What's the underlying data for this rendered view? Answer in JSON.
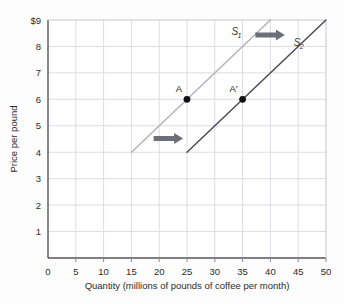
{
  "chart_data": {
    "type": "line",
    "title": "",
    "xlabel": "Quantity (millions of pounds of coffee per month)",
    "ylabel": "Price per pound",
    "xlim": [
      0,
      50
    ],
    "ylim": [
      0,
      9
    ],
    "xticks": [
      "0",
      "5",
      "10",
      "15",
      "20",
      "25",
      "30",
      "35",
      "40",
      "45",
      "50"
    ],
    "yticks": [
      "1",
      "2",
      "3",
      "4",
      "5",
      "6",
      "7",
      "8",
      "$9"
    ],
    "grid": true,
    "legend_position": "inline-curve-labels",
    "series": [
      {
        "name": "S1",
        "label": "S",
        "subscript": "1",
        "color": "#b3b3bb",
        "points": [
          [
            15,
            4
          ],
          [
            40,
            9
          ]
        ],
        "label_x": 33,
        "label_y": 8.45
      },
      {
        "name": "S2",
        "label": "S",
        "subscript": "2",
        "color": "#4c4c57",
        "points": [
          [
            25,
            4
          ],
          [
            50,
            9
          ]
        ],
        "label_x": 44.2,
        "label_y": 8.0
      }
    ],
    "points": [
      {
        "name": "A",
        "label": "A",
        "x": 25,
        "y": 6,
        "color": "#111111",
        "label_dx": -8,
        "label_dy": -7
      },
      {
        "name": "A-prime",
        "label": "A′",
        "x": 35,
        "y": 6,
        "color": "#111111",
        "label_dx": -9,
        "label_dy": -7
      }
    ],
    "annotations": [
      {
        "name": "shift-arrow-upper",
        "type": "block-arrow",
        "direction": "right",
        "color": "#6e6e78",
        "x_start": 37.3,
        "x_end": 42.6,
        "y": 8.43
      },
      {
        "name": "shift-arrow-lower",
        "type": "block-arrow",
        "direction": "right",
        "color": "#6e6e78",
        "x_start": 19.0,
        "x_end": 24.3,
        "y": 4.52
      }
    ],
    "colors": {
      "grid": "#dcdce2",
      "axis": "#55555e",
      "plot_background": "#ffffff",
      "text": "#2b2b2b"
    }
  }
}
